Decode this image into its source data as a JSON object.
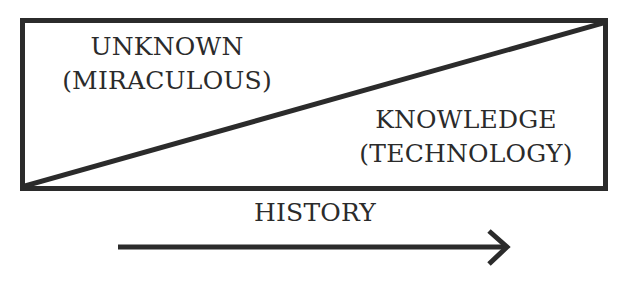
{
  "diagram": {
    "box": {
      "x": 22,
      "y": 20,
      "width": 584,
      "height": 169,
      "stroke": "#2b2b2b",
      "stroke_width": 5
    },
    "diagonal": {
      "from": [
        25,
        186
      ],
      "to": [
        603,
        23
      ],
      "stroke": "#2b2b2b",
      "stroke_width": 5
    },
    "upper_region": {
      "title": "UNKNOWN",
      "subtitle": "(MIRACULOUS)"
    },
    "lower_region": {
      "title": "KNOWLEDGE",
      "subtitle": "(TECHNOLOGY)"
    },
    "axis": {
      "label": "HISTORY",
      "arrow_from": [
        118,
        247
      ],
      "arrow_to": [
        508,
        247
      ],
      "direction": "right"
    },
    "colors": {
      "ink": "#2b2b2b",
      "background": "#ffffff"
    }
  }
}
